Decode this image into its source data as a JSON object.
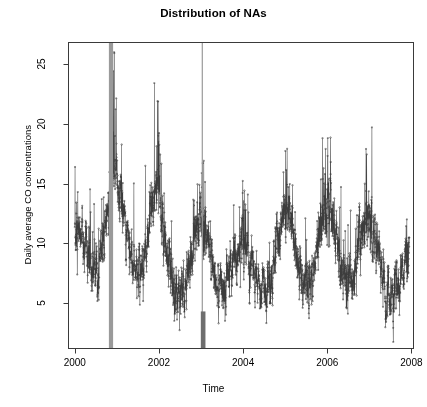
{
  "chart_data": {
    "type": "line",
    "title": "Distribution of NAs",
    "xlabel": "Time",
    "ylabel": "Daily average CO concentrations",
    "xlim": [
      1999.85,
      2008.05
    ],
    "ylim": [
      1.2,
      26.8
    ],
    "xticks": [
      2000,
      2002,
      2004,
      2006,
      2008
    ],
    "xticklabels": [
      "2000",
      "2002",
      "2004",
      "2006",
      "2008"
    ],
    "yticks": [
      5,
      10,
      15,
      20,
      25
    ],
    "yticklabels": [
      "5",
      "10",
      "15",
      "20",
      "25"
    ],
    "grid": false,
    "legend": null,
    "series": [
      {
        "name": "Daily average CO concentrations",
        "color": "#3c3c3c",
        "marker": "circle",
        "line": "solid",
        "x_start": 2000.0,
        "x_end": 2007.95,
        "n_points": 2900,
        "description": "Dense daily time series of CO concentration with strong annual seasonality: winter maxima reaching 15-25, summer minima near 2-4, baseline around 5-7.",
        "seasonal_peaks": [
          {
            "year": 2000.06,
            "value": 15.2
          },
          {
            "year": 2000.95,
            "value": 25.9
          },
          {
            "year": 2001.05,
            "value": 19.8
          },
          {
            "year": 2001.95,
            "value": 23.0
          },
          {
            "year": 2002.1,
            "value": 17.0
          },
          {
            "year": 2003.05,
            "value": 16.0
          },
          {
            "year": 2004.02,
            "value": 13.5
          },
          {
            "year": 2005.02,
            "value": 17.5
          },
          {
            "year": 2006.0,
            "value": 18.5
          },
          {
            "year": 2007.02,
            "value": 17.8
          },
          {
            "year": 2007.95,
            "value": 12.0
          }
        ],
        "seasonal_troughs": [
          {
            "year": 2000.55,
            "value": 3.6
          },
          {
            "year": 2001.55,
            "value": 3.4
          },
          {
            "year": 2002.58,
            "value": 2.6
          },
          {
            "year": 2003.55,
            "value": 3.0
          },
          {
            "year": 2004.55,
            "value": 3.1
          },
          {
            "year": 2005.58,
            "value": 3.0
          },
          {
            "year": 2006.55,
            "value": 3.0
          },
          {
            "year": 2007.55,
            "value": 2.8
          }
        ]
      }
    ],
    "na_markers": [
      {
        "name": "na-band-1",
        "x_center": 2000.86,
        "width_years": 0.1,
        "color": "#9a9a9a",
        "y_from": 1.2,
        "y_to": 26.8
      },
      {
        "name": "na-band-2",
        "x_center": 2003.03,
        "width_years": 0.02,
        "color": "#9a9a9a",
        "y_from": 1.2,
        "y_to": 26.8
      },
      {
        "name": "na-block-bottom",
        "x_center": 2003.05,
        "width_years": 0.11,
        "color": "#6e6e6e",
        "y_from": 1.2,
        "y_to": 4.3
      }
    ],
    "axis_color": "#3a3a3a",
    "background": "#ffffff"
  },
  "chart": {
    "title": "Distribution of NAs",
    "xlabel": "Time",
    "ylabel": "Daily average CO concentrations",
    "xticklabels": [
      "2000",
      "2002",
      "2004",
      "2006",
      "2008"
    ],
    "yticklabels": [
      "5",
      "10",
      "15",
      "20",
      "25"
    ]
  }
}
